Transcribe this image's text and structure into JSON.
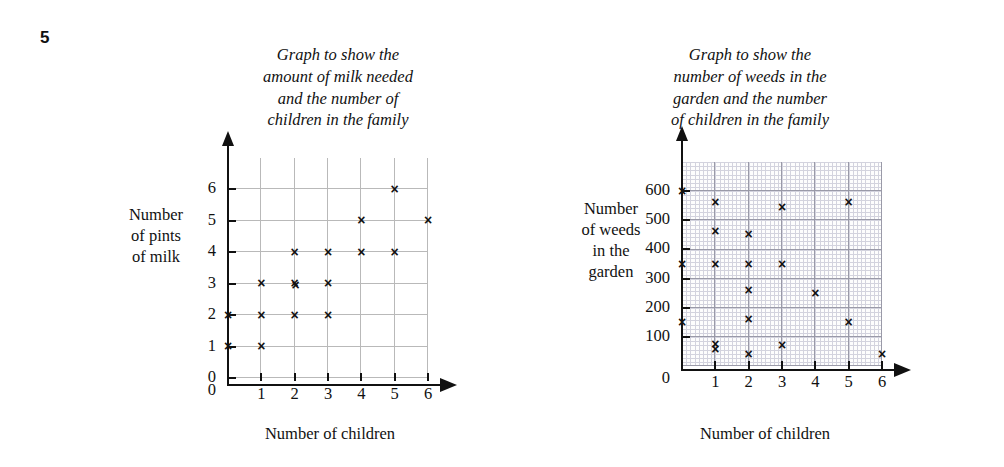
{
  "question_number": "5",
  "axis_common": {
    "xlabel": "Number of children",
    "x_ticks": [
      "0",
      "1",
      "2",
      "3",
      "4",
      "5",
      "6"
    ]
  },
  "charts": [
    {
      "id": "milk",
      "title": "Graph to show the\namount of milk needed\nand the number of\nchildren in the family",
      "ylabel": "Number\nof pints\nof milk",
      "xlabel": "Number of children",
      "y_ticks": [
        "0",
        "1",
        "2",
        "3",
        "4",
        "5",
        "6"
      ],
      "origin_label": "0"
    },
    {
      "id": "weeds",
      "title": "Graph to show the\nnumber of weeds in the\ngarden and the number\nof children in the family",
      "ylabel": "Number\nof weeds\nin the\ngarden",
      "xlabel": "Number of children",
      "y_ticks": [
        "100",
        "200",
        "300",
        "400",
        "500",
        "600"
      ],
      "origin_label": "0"
    }
  ],
  "chart_data": [
    {
      "type": "scatter",
      "id": "milk",
      "title": "Graph to show the amount of milk needed and the number of children in the family",
      "xlabel": "Number of children",
      "ylabel": "Number of pints of milk",
      "xlim": [
        0,
        6
      ],
      "ylim": [
        0,
        7
      ],
      "xticks": [
        0,
        1,
        2,
        3,
        4,
        5,
        6
      ],
      "yticks": [
        0,
        1,
        2,
        3,
        4,
        5,
        6
      ],
      "grid": true,
      "marker": "x",
      "legend": "none",
      "points": [
        {
          "x": 0,
          "y": 1
        },
        {
          "x": 0,
          "y": 2
        },
        {
          "x": 1,
          "y": 1
        },
        {
          "x": 1,
          "y": 2
        },
        {
          "x": 1,
          "y": 3
        },
        {
          "x": 2,
          "y": 2
        },
        {
          "x": 2,
          "y": 3
        },
        {
          "x": 2,
          "y": 3
        },
        {
          "x": 2,
          "y": 4
        },
        {
          "x": 3,
          "y": 2
        },
        {
          "x": 3,
          "y": 3
        },
        {
          "x": 3,
          "y": 4
        },
        {
          "x": 4,
          "y": 4
        },
        {
          "x": 4,
          "y": 5
        },
        {
          "x": 5,
          "y": 4
        },
        {
          "x": 5,
          "y": 6
        },
        {
          "x": 6,
          "y": 5
        }
      ]
    },
    {
      "type": "scatter",
      "id": "weeds",
      "title": "Graph to show the number of weeds in the garden and the number of children in the family",
      "xlabel": "Number of children",
      "ylabel": "Number of weeds in the garden",
      "xlim": [
        0,
        6
      ],
      "ylim": [
        0,
        700
      ],
      "xticks": [
        0,
        1,
        2,
        3,
        4,
        5,
        6
      ],
      "yticks": [
        100,
        200,
        300,
        400,
        500,
        600
      ],
      "grid": true,
      "marker": "x",
      "legend": "none",
      "points": [
        {
          "x": 0,
          "y": 600
        },
        {
          "x": 0,
          "y": 350
        },
        {
          "x": 0,
          "y": 150
        },
        {
          "x": 1,
          "y": 560
        },
        {
          "x": 1,
          "y": 460
        },
        {
          "x": 1,
          "y": 350
        },
        {
          "x": 1,
          "y": 75
        },
        {
          "x": 1,
          "y": 55
        },
        {
          "x": 2,
          "y": 450
        },
        {
          "x": 2,
          "y": 350
        },
        {
          "x": 2,
          "y": 260
        },
        {
          "x": 2,
          "y": 160
        },
        {
          "x": 2,
          "y": 40
        },
        {
          "x": 3,
          "y": 545
        },
        {
          "x": 3,
          "y": 350
        },
        {
          "x": 3,
          "y": 70
        },
        {
          "x": 4,
          "y": 250
        },
        {
          "x": 5,
          "y": 560
        },
        {
          "x": 5,
          "y": 150
        },
        {
          "x": 6,
          "y": 40
        }
      ]
    }
  ]
}
